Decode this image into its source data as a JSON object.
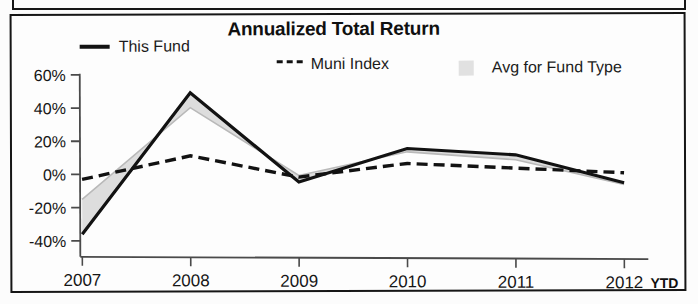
{
  "chart_data": {
    "type": "line",
    "title": "Annualized Total Return",
    "xlabel": "",
    "ylabel": "",
    "categories": [
      "2007",
      "2008",
      "2009",
      "2010",
      "2011",
      "2012"
    ],
    "x_axis_note": "YTD",
    "ylim": [
      -40,
      60
    ],
    "ytick_labels": [
      "60%",
      "40%",
      "20%",
      "0%",
      "-20%",
      "-40%"
    ],
    "ytick_values": [
      60,
      40,
      20,
      0,
      -20,
      -40
    ],
    "grid": false,
    "legend_position": "top",
    "series": [
      {
        "name": "This Fund",
        "style": "solid",
        "color": "#121212",
        "values": [
          -36,
          49,
          -5,
          15,
          11,
          -6
        ]
      },
      {
        "name": "Muni Index",
        "style": "dashed",
        "color": "#121212",
        "values": [
          -3,
          11,
          -2,
          6,
          3,
          0
        ]
      },
      {
        "name": "Avg for Fund Type",
        "style": "area",
        "color": "#d7d7d7",
        "values": [
          -15,
          40,
          -1,
          13,
          8,
          -7
        ]
      }
    ]
  },
  "chart": {
    "title": "Annualized Total Return",
    "legend": [
      {
        "label": "This Fund",
        "swatch": "solid-line-swatch"
      },
      {
        "label": "Muni Index",
        "swatch": "dashed-line-swatch"
      },
      {
        "label": "Avg for Fund Type",
        "swatch": "area-fill-swatch"
      }
    ],
    "y_axis": {
      "ticks": [
        "60%",
        "40%",
        "20%",
        "0%",
        "-20%",
        "-40%"
      ]
    },
    "x_axis": {
      "ticks": [
        "2007",
        "2008",
        "2009",
        "2010",
        "2011",
        "2012"
      ],
      "suffix": "YTD"
    }
  },
  "colors": {
    "line": "#121212",
    "area_fill": "#d7d7d7",
    "axis": "#4a4a4a",
    "frame": "#161616",
    "text": "#161616"
  }
}
